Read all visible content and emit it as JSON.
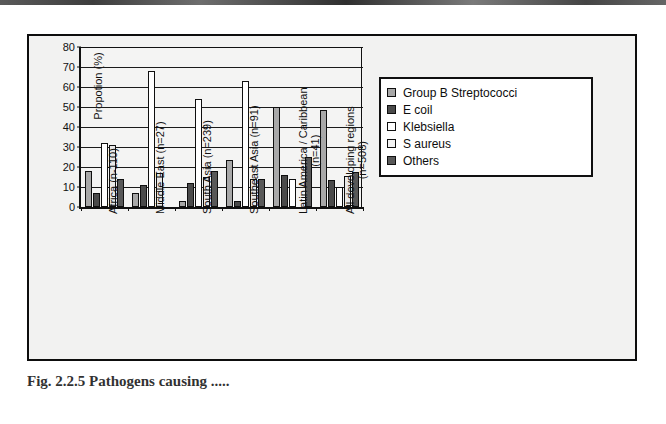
{
  "figure": {
    "caption": "Fig. 2.2.5  Pathogens causing ....."
  },
  "chart_data": {
    "type": "bar",
    "title": "",
    "xlabel": "",
    "ylabel": "Propotion (%)",
    "ylim": [
      0,
      80
    ],
    "yticks": [
      0,
      10,
      20,
      30,
      40,
      50,
      60,
      70,
      80
    ],
    "ytick_labels": [
      "0",
      "10",
      "20",
      "30",
      "40",
      "50",
      "60",
      "70",
      "80"
    ],
    "grid": true,
    "legend_position": "right",
    "categories": [
      "Africa (n-110)",
      "Middle East (n=27)",
      "South Asia (n=239)",
      "Southeast Asia (n=91)",
      "Latin America / Caribbean (n=41)",
      "All devoloping regions (n=508)"
    ],
    "category_lines": [
      [
        "Africa (n-110)"
      ],
      [
        "Middle East (n=27)"
      ],
      [
        "South Asia (n=239)"
      ],
      [
        "Southeast Asia (n=91)"
      ],
      [
        "Latin America / Caribbean",
        "(n=41)"
      ],
      [
        "All devoloping regions",
        "(n=508)"
      ]
    ],
    "series": [
      {
        "name": "Group B Streptococci",
        "color": "#a8a8a8",
        "values": [
          18,
          7,
          3,
          23.5,
          50,
          48.5
        ]
      },
      {
        "name": "E coil",
        "color": "#4a4a4a",
        "values": [
          7,
          11,
          12,
          3,
          16,
          13.5
        ]
      },
      {
        "name": "Klebsiella",
        "color": "#ffffff",
        "values": [
          32,
          68,
          54,
          63,
          14,
          10
        ]
      },
      {
        "name": "S aureus",
        "color": "#e8e8e8",
        "values": [
          31,
          17,
          15,
          14,
          0,
          15.5
        ]
      },
      {
        "name": "Others",
        "color": "#585858",
        "values": [
          14,
          0,
          18,
          14,
          25,
          17.5
        ]
      }
    ]
  }
}
